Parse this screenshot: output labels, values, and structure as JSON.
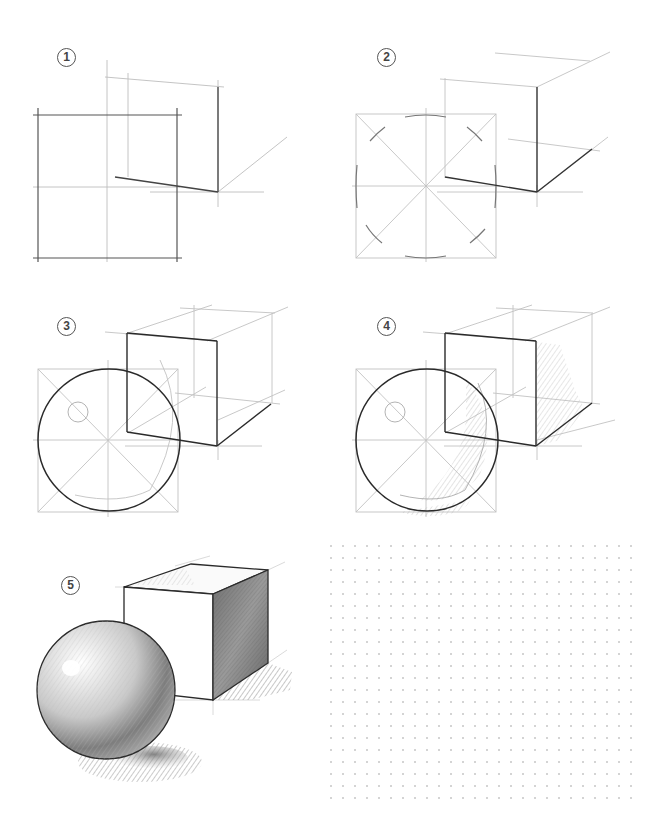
{
  "steps": [
    {
      "number": "1",
      "glyph": "①",
      "description": "Construction square with cross-hair guides and a perspective corner of the cube"
    },
    {
      "number": "2",
      "glyph": "②",
      "description": "Diagonals and arc ticks inside the square; cube base edges darkened"
    },
    {
      "number": "3",
      "glyph": "③",
      "description": "Sphere outline drawn in the square, highlight circle, cube front face outlined"
    },
    {
      "number": "4",
      "glyph": "④",
      "description": "Initial hatching for core shadow on sphere and shaded side of cube"
    },
    {
      "number": "5",
      "glyph": "⑤",
      "description": "Fully rendered shaded sphere and cube with cast shadows"
    }
  ],
  "practice_area": {
    "type": "dot-grid",
    "description": "Blank dotted practice area",
    "dot_spacing_px": 12
  },
  "colors": {
    "paper": "#ffffff",
    "guide_line": "#bdbdbd",
    "contour_line": "#2a2a2a",
    "label": "#444444",
    "dot": "#d4d4d4",
    "shade": "#8a8a8a"
  }
}
